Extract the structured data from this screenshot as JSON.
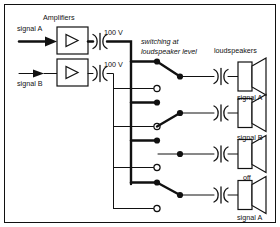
{
  "diagram": {
    "title_amplifiers": "Amplifiers",
    "label_loudspeakers": "loudspeakers",
    "note_line1": "switching at",
    "note_line2": "loudspeaker level",
    "inputs": [
      {
        "label": "signal A"
      },
      {
        "label": "signal B"
      }
    ],
    "line_voltages": [
      {
        "value": "100 V"
      },
      {
        "value": "100 V"
      }
    ],
    "speakers": [
      {
        "label": "signal A",
        "state": "A"
      },
      {
        "label": "signal B",
        "state": "B"
      },
      {
        "label": "off",
        "state": "off"
      },
      {
        "label": "signal A",
        "state": "A"
      }
    ],
    "bus": {
      "a_label": "signal A bus",
      "b_label": "signal B bus"
    },
    "colors": {
      "ink": "#111111",
      "paper": "#ffffff"
    },
    "icons": {
      "amplifier": "triangle-amplifier-icon",
      "transformer": "transformer-icon",
      "speaker": "loudspeaker-icon",
      "switch": "spdt-switch-icon",
      "arrow": "input-arrow-icon"
    }
  }
}
